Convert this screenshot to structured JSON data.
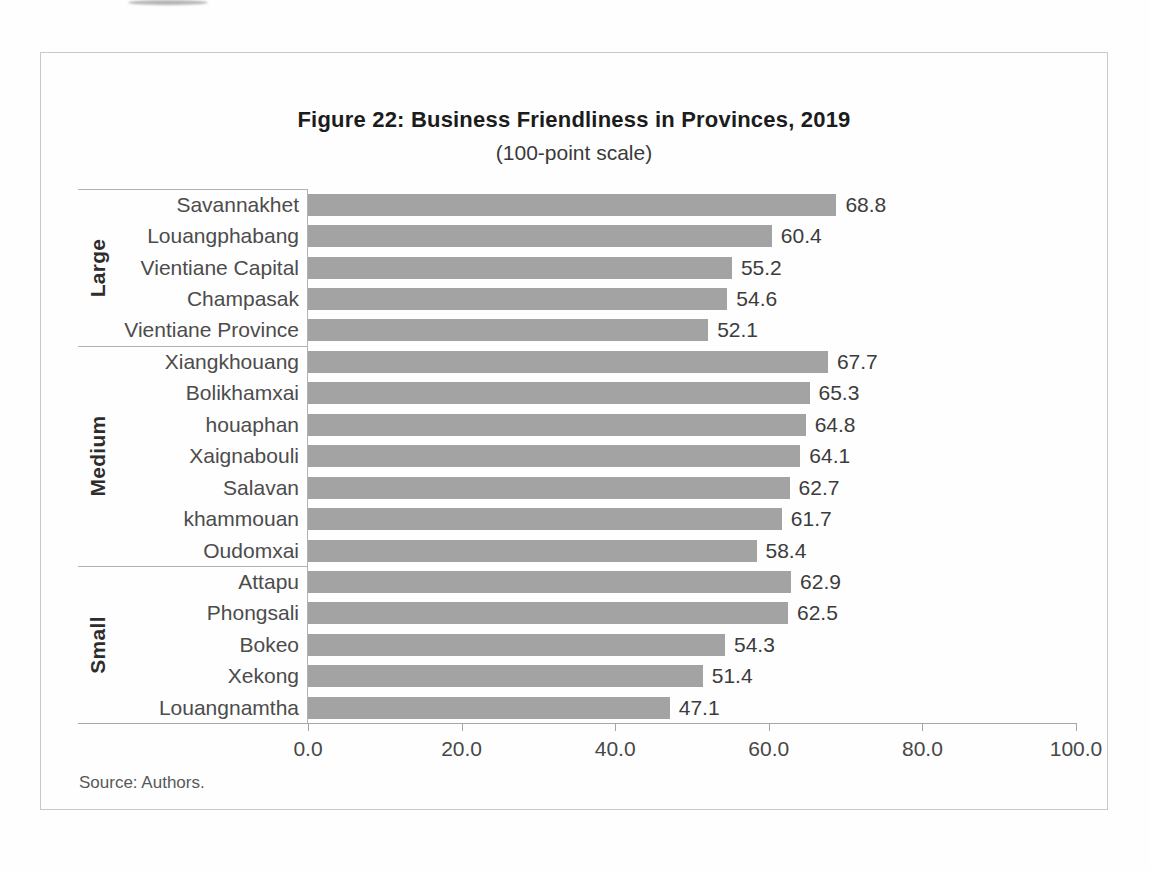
{
  "figure": {
    "title": "Figure 22: Business Friendliness in Provinces, 2019",
    "subtitle": "(100-point scale)",
    "source": "Source: Authors."
  },
  "chart_data": {
    "type": "bar",
    "orientation": "horizontal",
    "title": "Figure 22: Business Friendliness in Provinces, 2019",
    "subtitle": "(100-point scale)",
    "xlabel": "",
    "ylabel": "",
    "xlim": [
      0,
      100
    ],
    "x_ticks": [
      "0.0",
      "20.0",
      "40.0",
      "60.0",
      "80.0",
      "100.0"
    ],
    "grid": false,
    "legend": "none",
    "bar_color": "#a3a3a3",
    "groups": [
      {
        "label": "Large",
        "items": [
          {
            "name": "Savannakhet",
            "value": 68.8
          },
          {
            "name": "Louangphabang",
            "value": 60.4
          },
          {
            "name": "Vientiane Capital",
            "value": 55.2
          },
          {
            "name": "Champasak",
            "value": 54.6
          },
          {
            "name": "Vientiane Province",
            "value": 52.1
          }
        ]
      },
      {
        "label": "Medium",
        "items": [
          {
            "name": "Xiangkhouang",
            "value": 67.7
          },
          {
            "name": "Bolikhamxai",
            "value": 65.3
          },
          {
            "name": "houaphan",
            "value": 64.8
          },
          {
            "name": "Xaignabouli",
            "value": 64.1
          },
          {
            "name": "Salavan",
            "value": 62.7
          },
          {
            "name": "khammouan",
            "value": 61.7
          },
          {
            "name": "Oudomxai",
            "value": 58.4
          }
        ]
      },
      {
        "label": "Small",
        "items": [
          {
            "name": "Attapu",
            "value": 62.9
          },
          {
            "name": "Phongsali",
            "value": 62.5
          },
          {
            "name": "Bokeo",
            "value": 54.3
          },
          {
            "name": "Xekong",
            "value": 51.4
          },
          {
            "name": "Louangnamtha",
            "value": 47.1
          }
        ]
      }
    ]
  }
}
